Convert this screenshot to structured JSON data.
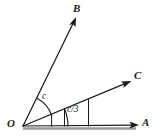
{
  "figure": {
    "width": 153,
    "height": 137,
    "background_color": "#ffffff",
    "stroke_color": "#1a1a1a",
    "baseline_color": "#8a8a8a",
    "vertex": {
      "name": "O",
      "label": "O",
      "x": 23,
      "y": 126
    },
    "rays": [
      {
        "id": "ray-a",
        "label": "A",
        "from": {
          "x": 23,
          "y": 126
        },
        "to": {
          "x": 139,
          "y": 125
        },
        "arrowhead": true,
        "angle_deg": 0
      },
      {
        "id": "ray-c",
        "label": "C",
        "from": {
          "x": 23,
          "y": 126
        },
        "to": {
          "x": 131,
          "y": 81
        },
        "arrowhead": true,
        "angle_deg": 22.6
      },
      {
        "id": "ray-b",
        "label": "B",
        "from": {
          "x": 23,
          "y": 126
        },
        "to": {
          "x": 76,
          "y": 17
        },
        "arrowhead": true,
        "angle_deg": 64
      }
    ],
    "arcs": [
      {
        "id": "arc-c",
        "label": "c",
        "between": [
          "ray-b",
          "ray-c"
        ],
        "radius": 31,
        "label_x": 45,
        "label_y": 98
      },
      {
        "id": "arc-c-over-3",
        "label": "c/3",
        "between": [
          "ray-c",
          "ray-a"
        ],
        "radius": 45,
        "label_x": 76,
        "label_y": 112
      }
    ],
    "tick_marks": [
      {
        "id": "tick-arc-c-end",
        "x1": 51,
        "y1": 115,
        "x2": 51,
        "y2": 126
      },
      {
        "id": "tick-arc-c3-end",
        "x1": 68,
        "y1": 107,
        "x2": 68,
        "y2": 126
      },
      {
        "id": "tick-arc-c3-boundary",
        "x1": 88,
        "y1": 99,
        "x2": 88,
        "y2": 126
      }
    ]
  }
}
